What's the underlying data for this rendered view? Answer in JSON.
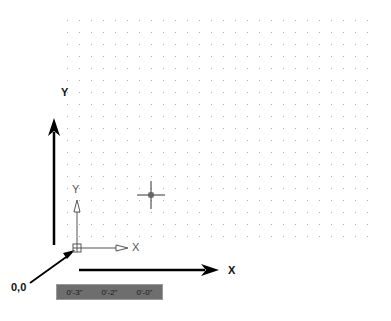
{
  "diagram": {
    "grid": {
      "x0": 67,
      "y0": 20,
      "x1": 370,
      "y1": 242,
      "spacing": 12,
      "dot_color": "#b0b0b0"
    },
    "labels": {
      "y_axis": "Y",
      "x_axis": "X",
      "origin": "0,0",
      "ucs_y": "Y",
      "ucs_x": "X"
    },
    "crosshair": {
      "x": 151,
      "y": 195,
      "arm": 14
    },
    "ucs_icon": {
      "x": 77,
      "y": 248
    },
    "colors": {
      "arrow": "#000000",
      "ucs": "#555555",
      "statusbar_bg": "#6e6e6e"
    }
  },
  "statusbar": {
    "coords": [
      "0'-3\"",
      "0'-2\"",
      "0'-0\""
    ]
  }
}
